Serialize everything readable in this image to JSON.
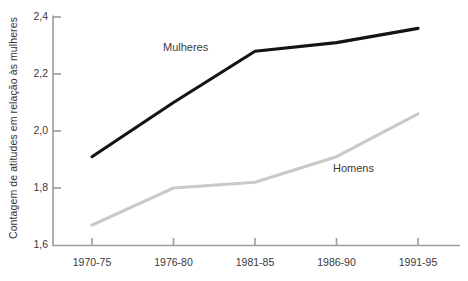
{
  "chart_data": {
    "type": "line",
    "title": "",
    "subtitle": "",
    "xlabel": "",
    "ylabel": "Contagem de atitudes em relação às mulheres",
    "categories": [
      "1970-75",
      "1976-80",
      "1981-85",
      "1986-90",
      "1991-95"
    ],
    "yticks": [
      "1,6",
      "1,8",
      "2,0",
      "2,2",
      "2,4"
    ],
    "ytick_values": [
      1.6,
      1.8,
      2.0,
      2.2,
      2.4
    ],
    "ylim": [
      1.6,
      2.4
    ],
    "grid": false,
    "legend_position": "inline-annotation",
    "series": [
      {
        "name": "Mulheres",
        "color": "#141414",
        "values": [
          1.91,
          2.1,
          2.28,
          2.31,
          2.36
        ],
        "annotation": {
          "text": "Mulheres",
          "x": 1.02,
          "y": 2.29
        }
      },
      {
        "name": "Homens",
        "color": "#c9c9c9",
        "values": [
          1.67,
          1.8,
          1.82,
          1.91,
          2.06
        ],
        "annotation": {
          "text": "Homens",
          "x": 3.02,
          "y": 1.86
        }
      }
    ],
    "annotations": [
      {
        "name": "mulheres-label",
        "text": "Mulheres"
      },
      {
        "name": "homens-label",
        "text": "Homens"
      }
    ],
    "axis_color": "#9b9b9b",
    "background": "#ffffff"
  }
}
